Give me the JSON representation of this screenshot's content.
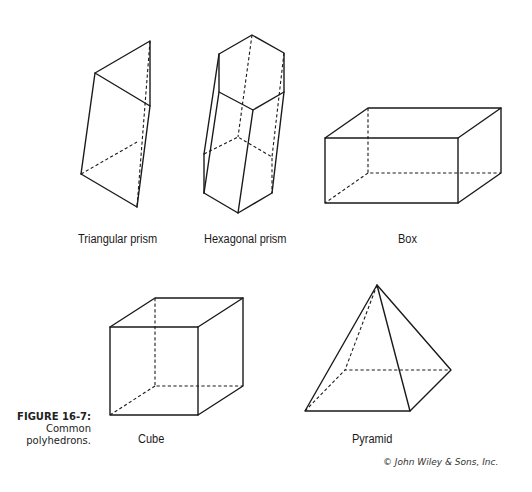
{
  "figure": {
    "number": "FIGURE 16-7:",
    "caption": "Common polyhedrons.",
    "caption_lines": [
      "Common",
      "polyhedrons."
    ],
    "copyright": "© John Wiley & Sons, Inc."
  },
  "shapes": [
    {
      "id": "triangular-prism",
      "label": "Triangular prism"
    },
    {
      "id": "hexagonal-prism",
      "label": "Hexagonal prism"
    },
    {
      "id": "box",
      "label": "Box"
    },
    {
      "id": "cube",
      "label": "Cube"
    },
    {
      "id": "pyramid",
      "label": "Pyramid"
    }
  ],
  "colors": {
    "line": "#1a1a1a",
    "background": "#ffffff"
  }
}
